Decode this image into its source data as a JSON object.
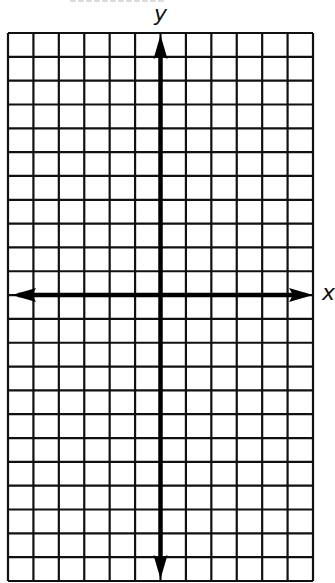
{
  "diagram": {
    "type": "coordinate-grid",
    "x_axis_label": "x",
    "y_axis_label": "y",
    "columns": 12,
    "rows": 23,
    "columns_left_of_y_axis": 6,
    "columns_right_of_y_axis": 6,
    "rows_above_x_axis": 11,
    "rows_below_x_axis": 12,
    "grid_color": "#111111",
    "axis_color": "#000000",
    "background": "#ffffff"
  }
}
